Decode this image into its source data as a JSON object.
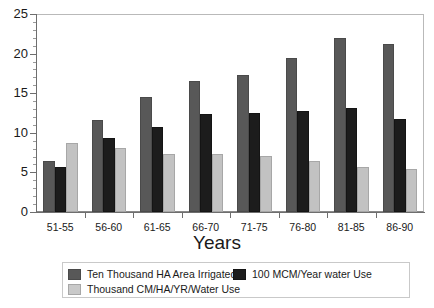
{
  "chart_data": {
    "type": "bar",
    "title": "",
    "subtitle": "",
    "xlabel": "Years",
    "ylabel": "",
    "categories": [
      "51-55",
      "56-60",
      "61-65",
      "66-70",
      "71-75",
      "76-80",
      "81-85",
      "86-90"
    ],
    "series": [
      {
        "name": "Ten Thousand HA Area Irrigated",
        "color": "#585858",
        "values": [
          6.5,
          11.6,
          14.5,
          16.6,
          17.3,
          19.4,
          22.0,
          21.2
        ]
      },
      {
        "name": "100 MCM/Year water Use",
        "color": "#1c1c1c",
        "values": [
          5.7,
          9.4,
          10.7,
          12.4,
          12.5,
          12.8,
          13.1,
          11.8
        ]
      },
      {
        "name": "Thousand  CM/HA/YR/Water Use",
        "color": "#c9c9c9",
        "values": [
          8.7,
          8.1,
          7.3,
          7.3,
          7.1,
          6.5,
          5.7,
          5.4
        ]
      }
    ],
    "ylim": [
      0,
      25
    ],
    "yticks": [
      0,
      5,
      10,
      15,
      20,
      25
    ],
    "ytick_labels": [
      "0",
      "5",
      "10",
      "15",
      "20",
      "25"
    ],
    "yminor_step": 1,
    "grid": false,
    "legend_position": "bottom"
  },
  "legend": {
    "items": [
      {
        "label": "Ten Thousand HA Area Irrigated"
      },
      {
        "label": "100 MCM/Year water Use"
      },
      {
        "label": "Thousand  CM/HA/YR/Water Use"
      }
    ]
  }
}
